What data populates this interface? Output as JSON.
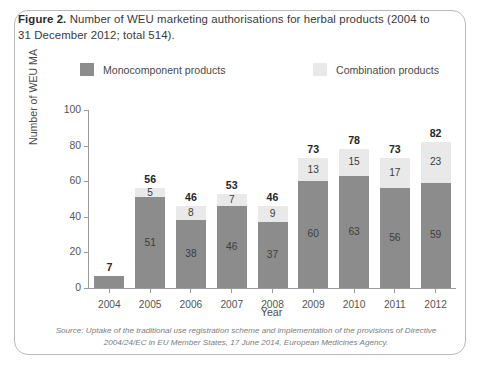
{
  "figure": {
    "label": "Figure 2.",
    "caption": "Number of WEU marketing authorisations for herbal products (2004 to 31 December 2012; total 514)."
  },
  "legend": {
    "monocomponent": "Monocomponent products",
    "combination": "Combination products",
    "monocomponent_color": "#8c8c8c",
    "combination_color": "#e9e9e9"
  },
  "source": {
    "line1": "Source: Uptake of the traditional use registration scheme and implementation of the provisions of",
    "line2": "Directive 2004/24/EC in EU Member States, 17 June 2014, European Medicines Agency."
  },
  "chart_data": {
    "type": "bar",
    "stacked": true,
    "title": "Number of WEU marketing authorisations for herbal products",
    "xlabel": "Year",
    "ylabel": "Number of WEU MA",
    "ylim": [
      0,
      100
    ],
    "yticks": [
      0,
      20,
      40,
      60,
      80,
      100
    ],
    "grid": false,
    "legend_position": "top",
    "categories": [
      "2004",
      "2005",
      "2006",
      "2007",
      "2008",
      "2009",
      "2010",
      "2011",
      "2012"
    ],
    "series": [
      {
        "name": "Monocomponent products",
        "color": "#8c8c8c",
        "values": [
          7,
          51,
          38,
          46,
          37,
          60,
          63,
          56,
          59
        ],
        "labels": [
          "",
          "51",
          "38",
          "46",
          "37",
          "60",
          "63",
          "56",
          "59"
        ]
      },
      {
        "name": "Combination products",
        "color": "#e9e9e9",
        "values": [
          0,
          5,
          8,
          7,
          9,
          13,
          15,
          17,
          23
        ],
        "labels": [
          "",
          "5",
          "8",
          "7",
          "9",
          "13",
          "15",
          "17",
          "23"
        ]
      }
    ],
    "totals": [
      7,
      56,
      46,
      53,
      46,
      73,
      78,
      73,
      82
    ],
    "grand_total": 514
  }
}
